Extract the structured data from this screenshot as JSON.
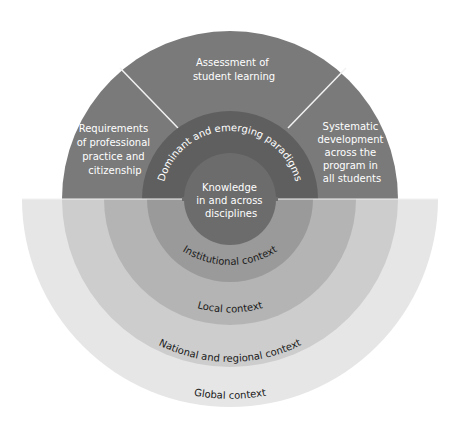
{
  "diagram": {
    "center": {
      "x": 230,
      "y": 199
    },
    "colors": {
      "upper_outer": "#7a7a7a",
      "paradigms": "#5f5f5f",
      "knowledge": "#6c6c6c",
      "institutional": "#9a9a9a",
      "local": "#b4b4b4",
      "national": "#cdcdcd",
      "global": "#e6e6e6",
      "divider": "#f2f2f2"
    },
    "upper_segments": [
      {
        "lines": [
          "Assessment of",
          "student learning"
        ]
      },
      {
        "lines": [
          "Requirements",
          "of professional",
          "practice and",
          "citizenship"
        ]
      },
      {
        "lines": [
          "Systematic",
          "development",
          "across the",
          "program in",
          "all students"
        ]
      }
    ],
    "paradigms_label": "Dominant and emerging paradigms",
    "core": {
      "lines": [
        "Knowledge",
        "in and across",
        "disciplines"
      ]
    },
    "context_rings": [
      {
        "label": "Institutional context"
      },
      {
        "label": "Local context"
      },
      {
        "label": "National and regional context"
      },
      {
        "label": "Global context"
      }
    ]
  }
}
